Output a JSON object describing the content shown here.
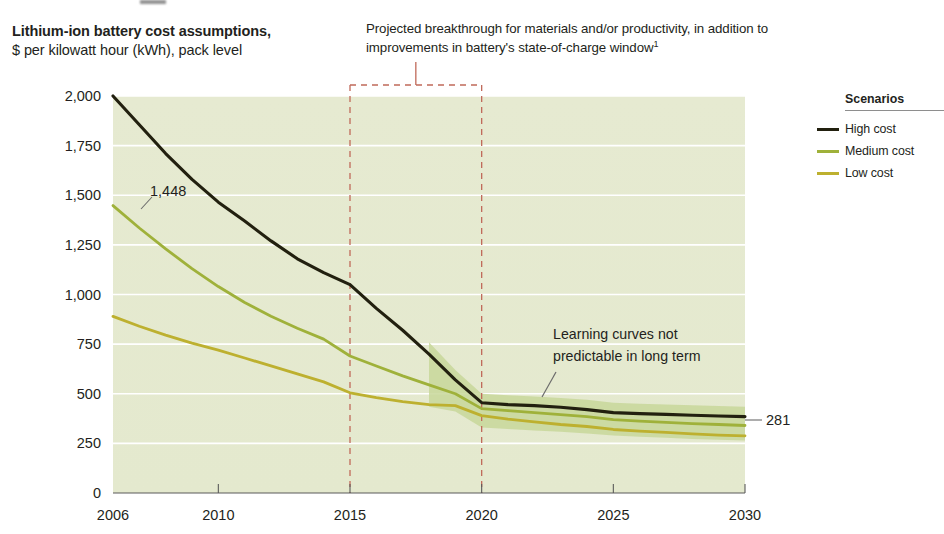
{
  "header": {
    "title": "Lithium-ion battery cost assumptions,",
    "subtitle": "$ per kilowatt hour (kWh), pack level",
    "callout_note": "Projected breakthrough for materials and/or productivity, in addition to improvements in battery's state-of-charge window",
    "callout_note_footnote": "1"
  },
  "legend": {
    "title": "Scenarios",
    "items": [
      {
        "label": "High cost",
        "color": "#22200f"
      },
      {
        "label": "Medium cost",
        "color": "#9fb13a"
      },
      {
        "label": "Low cost",
        "color": "#bdb02f"
      }
    ]
  },
  "annotations": {
    "learning_curve_line1": "Learning curves not",
    "learning_curve_line2": "predictable in long term",
    "start_value_label": "1,448",
    "end_value_label": "281"
  },
  "chart_data": {
    "type": "line",
    "title": "Lithium-ion battery cost assumptions,",
    "subtitle": "$ per kilowatt hour (kWh), pack level",
    "xlabel": "",
    "ylabel": "$ per kilowatt hour (kWh), pack level",
    "xlim": [
      2006,
      2030
    ],
    "ylim": [
      0,
      2000
    ],
    "yticks": [
      0,
      250,
      500,
      750,
      1000,
      1250,
      1500,
      1750,
      2000
    ],
    "ytick_labels": [
      "0",
      "250",
      "500",
      "750",
      "1,000",
      "1,250",
      "1,500",
      "1,750",
      "2,000"
    ],
    "xticks": [
      2006,
      2010,
      2015,
      2020,
      2025,
      2030
    ],
    "xtick_labels": [
      "2006",
      "2010",
      "2015",
      "2020",
      "2025",
      "2030"
    ],
    "grid": "horizontal",
    "legend_position": "right",
    "x": [
      2006,
      2007,
      2008,
      2009,
      2010,
      2011,
      2012,
      2013,
      2014,
      2015,
      2016,
      2017,
      2018,
      2019,
      2020,
      2021,
      2022,
      2023,
      2024,
      2025,
      2026,
      2027,
      2028,
      2029,
      2030
    ],
    "series": [
      {
        "name": "High cost",
        "color": "#22200f",
        "values": [
          2000,
          1855,
          1710,
          1580,
          1465,
          1370,
          1270,
          1180,
          1110,
          1050,
          930,
          820,
          700,
          570,
          455,
          445,
          440,
          432,
          420,
          405,
          400,
          396,
          392,
          388,
          385
        ]
      },
      {
        "name": "Medium cost",
        "color": "#9fb13a",
        "values": [
          1448,
          1335,
          1230,
          1130,
          1040,
          960,
          890,
          830,
          775,
          690,
          640,
          590,
          545,
          500,
          425,
          415,
          405,
          395,
          385,
          370,
          362,
          356,
          350,
          345,
          340
        ]
      },
      {
        "name": "Low cost",
        "color": "#bdb02f",
        "values": [
          890,
          840,
          795,
          755,
          720,
          680,
          640,
          600,
          560,
          505,
          480,
          460,
          445,
          440,
          390,
          372,
          358,
          345,
          335,
          320,
          312,
          305,
          298,
          292,
          288
        ]
      }
    ],
    "uncertainty_band": {
      "x_start": 2018,
      "x_end": 2030,
      "upper": [
        760,
        620,
        500,
        492,
        486,
        478,
        470,
        455,
        450,
        446,
        442,
        438,
        435
      ],
      "lower": [
        435,
        410,
        330,
        322,
        315,
        308,
        300,
        290,
        284,
        278,
        272,
        268,
        264
      ],
      "color": "#c8d79a"
    },
    "breakthrough_window": {
      "x_start": 2015,
      "x_end": 2020,
      "style": "dashed",
      "color": "#c06a5a"
    },
    "annotations": [
      {
        "text": "1,448",
        "x": 2006,
        "y": 1448
      },
      {
        "text": "281",
        "x": 2030,
        "y": 385
      },
      {
        "text": "Learning curves not predictable in long term",
        "x": 2024,
        "y": 780
      }
    ]
  }
}
